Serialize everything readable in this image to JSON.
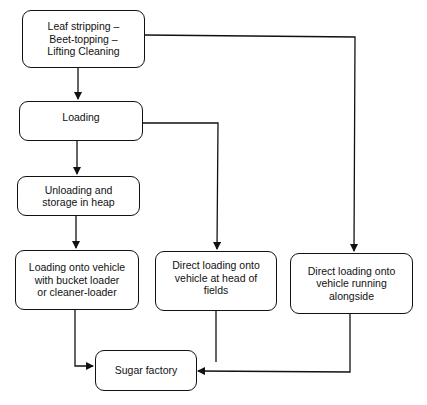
{
  "diagram": {
    "type": "flowchart",
    "nodes": [
      {
        "id": "harvest",
        "label": "Leaf stripping – Beet-topping – Lifting  Cleaning",
        "lines": [
          "Leaf stripping –",
          "Beet-topping –",
          "Lifting  Cleaning"
        ]
      },
      {
        "id": "loading",
        "label": "Loading",
        "lines": [
          "Loading"
        ]
      },
      {
        "id": "unloading",
        "label": "Unloading and storage in heap",
        "lines": [
          "Unloading and",
          "storage in heap"
        ]
      },
      {
        "id": "bucket_loader",
        "label": "Loading onto vehicle with bucket loader or cleaner-loader",
        "lines": [
          "Loading onto vehicle",
          "with bucket loader",
          "or cleaner-loader"
        ]
      },
      {
        "id": "head_of_fields",
        "label": "Direct loading onto vehicle at head of fields",
        "lines": [
          "Direct loading onto",
          "vehicle at head of",
          "fields"
        ]
      },
      {
        "id": "alongside",
        "label": "Direct loading onto vehicle running alongside",
        "lines": [
          "Direct loading onto",
          "vehicle running",
          "alongside"
        ]
      },
      {
        "id": "factory",
        "label": "Sugar factory",
        "lines": [
          "Sugar factory"
        ]
      }
    ],
    "edges": [
      {
        "from": "harvest",
        "to": "loading"
      },
      {
        "from": "harvest",
        "to": "alongside"
      },
      {
        "from": "loading",
        "to": "unloading"
      },
      {
        "from": "loading",
        "to": "head_of_fields"
      },
      {
        "from": "unloading",
        "to": "bucket_loader"
      },
      {
        "from": "bucket_loader",
        "to": "factory"
      },
      {
        "from": "head_of_fields",
        "to": "factory"
      },
      {
        "from": "alongside",
        "to": "factory"
      }
    ],
    "colors": {
      "line": "#111111",
      "background": "#ffffff"
    }
  }
}
